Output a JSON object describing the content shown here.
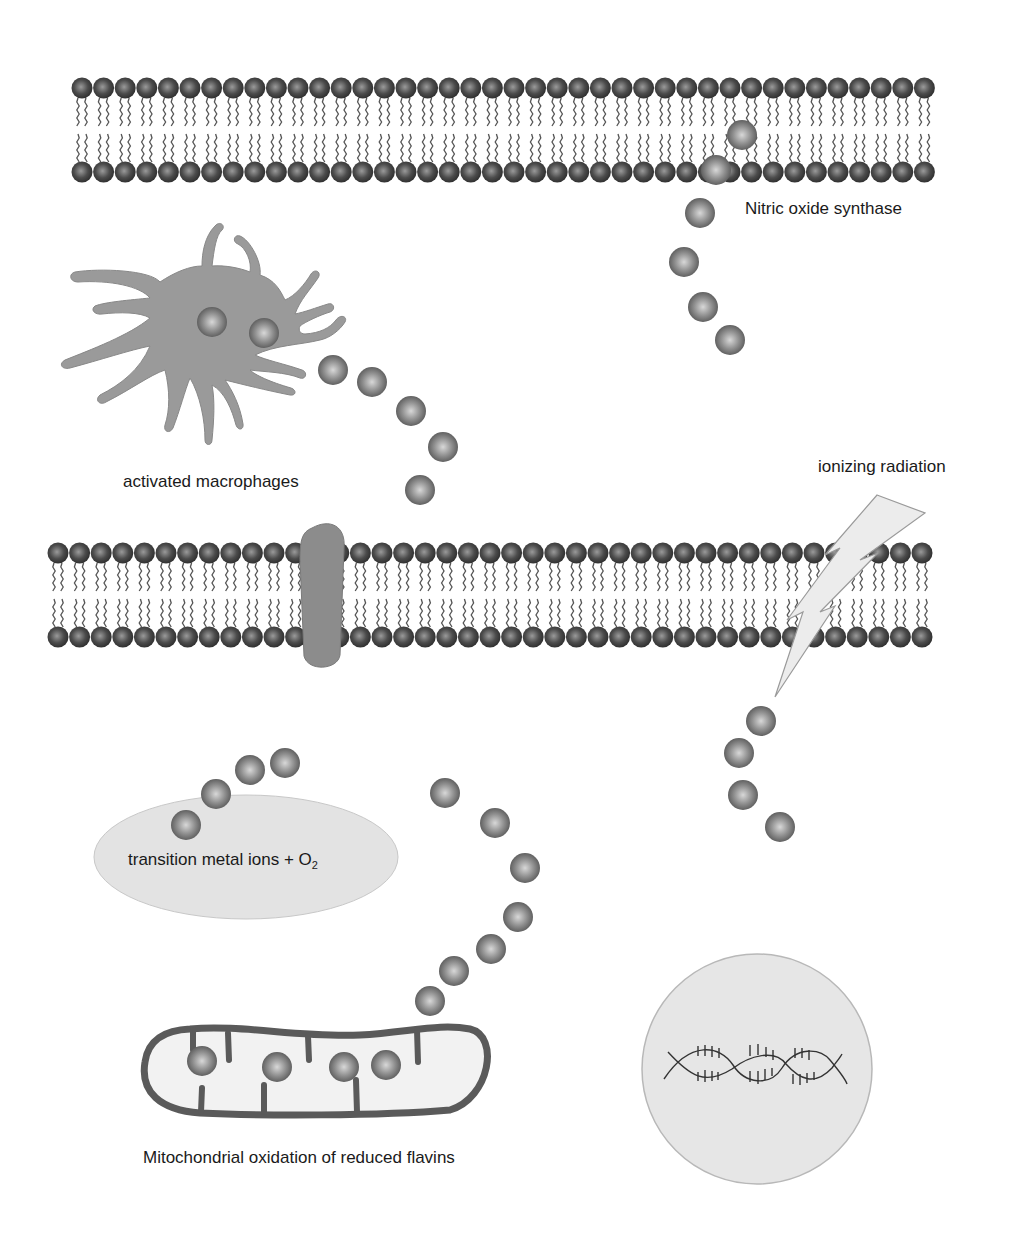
{
  "labels": {
    "nos": "Nitric oxide synthase",
    "macrophages": "activated macrophages",
    "radiation": "ionizing radiation",
    "metal_ions": "transition metal ions + O",
    "metal_ions_sub": "2",
    "mitochondria": "Mitochondrial oxidation of reduced flavins"
  },
  "colors": {
    "background": "#ffffff",
    "lipid_head": "#4a4a4a",
    "lipid_tail": "#555555",
    "radical_sphere": "#8a8a8a",
    "macrophage": "#9a9a9a",
    "channel_protein": "#8c8c8c",
    "ellipse_fill": "#e3e3e3",
    "nucleus_fill": "#e6e6e6",
    "mitochondrion_outline": "#5a5a5a",
    "lightning_fill": "#eeeeee"
  },
  "membranes": [
    {
      "id": "top",
      "x_start": 82,
      "x_end": 930,
      "top_row_y": 88,
      "bottom_row_y": 172
    },
    {
      "id": "middle",
      "x_start": 58,
      "x_end": 930,
      "top_row_y": 553,
      "bottom_row_y": 637
    }
  ],
  "radical_groups": [
    {
      "id": "nos-stream",
      "points": [
        [
          742,
          135
        ],
        [
          716,
          170
        ],
        [
          700,
          213
        ],
        [
          684,
          262
        ],
        [
          703,
          307
        ],
        [
          730,
          340
        ]
      ]
    },
    {
      "id": "macrophage-internal",
      "points": [
        [
          212,
          322
        ],
        [
          264,
          333
        ]
      ]
    },
    {
      "id": "macrophage-stream",
      "points": [
        [
          333,
          370
        ],
        [
          372,
          382
        ],
        [
          411,
          411
        ],
        [
          443,
          447
        ],
        [
          420,
          490
        ]
      ]
    },
    {
      "id": "radiation-stream",
      "points": [
        [
          761,
          721
        ],
        [
          739,
          753
        ],
        [
          743,
          795
        ],
        [
          780,
          827
        ]
      ]
    },
    {
      "id": "metal-ion-stream",
      "points": [
        [
          186,
          825
        ],
        [
          216,
          794
        ],
        [
          250,
          770
        ],
        [
          285,
          763
        ]
      ]
    },
    {
      "id": "mitochondria-stream",
      "points": [
        [
          445,
          793
        ],
        [
          495,
          823
        ],
        [
          525,
          868
        ],
        [
          518,
          917
        ],
        [
          491,
          949
        ],
        [
          454,
          971
        ],
        [
          430,
          1001
        ]
      ]
    },
    {
      "id": "mitochondria-internal",
      "points": [
        [
          202,
          1061
        ],
        [
          277,
          1067
        ],
        [
          344,
          1067
        ],
        [
          386,
          1065
        ]
      ]
    }
  ]
}
